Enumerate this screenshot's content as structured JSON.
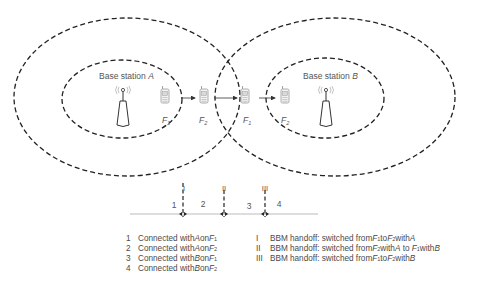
{
  "diagram": {
    "base_stations": [
      {
        "id": "A",
        "label_prefix": "Base station ",
        "label_name": "A"
      },
      {
        "id": "B",
        "label_prefix": "Base station ",
        "label_name": "B"
      }
    ],
    "terminals": [
      {
        "position": 1,
        "freq_base": "F",
        "freq_sub": "2"
      },
      {
        "position": 2,
        "freq_base": "F",
        "freq_sub": "2"
      },
      {
        "position": 3,
        "freq_base": "F",
        "freq_sub": "1"
      },
      {
        "position": 4,
        "freq_base": "F",
        "freq_sub": "2"
      }
    ],
    "timeline": {
      "segments": [
        "1",
        "2",
        "3",
        "4"
      ],
      "markers": [
        "I",
        "II",
        "III"
      ]
    }
  },
  "legend_left": [
    {
      "num": "1",
      "text": "Connected with ",
      "station": "A",
      "mid": " on ",
      "freq": "F",
      "sub": "1"
    },
    {
      "num": "2",
      "text": "Connected with ",
      "station": "A",
      "mid": " on ",
      "freq": "F",
      "sub": "2"
    },
    {
      "num": "3",
      "text": "Connected with ",
      "station": "B",
      "mid": " on ",
      "freq": "F",
      "sub": "1"
    },
    {
      "num": "4",
      "text": "Connected with ",
      "station": "B",
      "mid": " on ",
      "freq": "F",
      "sub": "2"
    }
  ],
  "legend_right": [
    {
      "num": "I",
      "text": "BBM handoff: switched from F1 to F2 with A",
      "p1": "BBM handoff: switched from ",
      "f1": "F",
      "s1": "1",
      "p2": " to ",
      "f2": "F",
      "s2": "2",
      "p3": " with ",
      "st": "A",
      "p4": "",
      "st2": ""
    },
    {
      "num": "II",
      "text": "BBM handoff: switched from F2 with A to F1 with B",
      "p1": "BBM handoff: switched from ",
      "f1": "F",
      "s1": "2",
      "p2": " with ",
      "f2": "",
      "s2": "",
      "p3": "",
      "st": "A",
      "p4": " to F",
      "p4sub": "1",
      "p5": " with ",
      "st2": "B"
    },
    {
      "num": "III",
      "text": "BBM handoff: switched from F1 to F2 with B",
      "p1": "BBM handoff: switched from ",
      "f1": "F",
      "s1": "1",
      "p2": " to ",
      "f2": "F",
      "s2": "2",
      "p3": " with ",
      "st": "B",
      "p4": "",
      "st2": ""
    }
  ]
}
